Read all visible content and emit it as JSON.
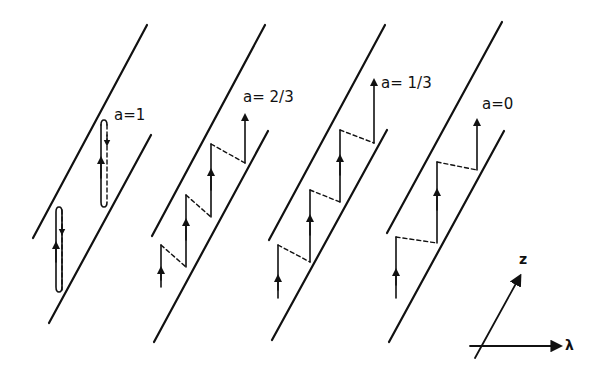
{
  "figure": {
    "panels": [
      {
        "id": "a1",
        "label": "a=1"
      },
      {
        "id": "a23",
        "label": "a= 2/3"
      },
      {
        "id": "a13",
        "label": "a= 1/3"
      },
      {
        "id": "a0",
        "label": "a=0"
      }
    ],
    "axes": {
      "vertical_label": "z",
      "horizontal_label": "λ"
    },
    "colors": {
      "ink": "#111111",
      "background": "#ffffff"
    }
  }
}
